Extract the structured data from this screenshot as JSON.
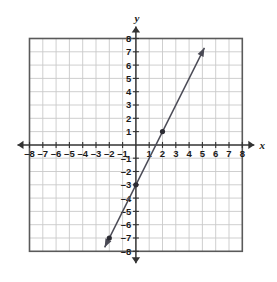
{
  "chart_data": {
    "type": "line",
    "title": "",
    "xlabel": "x",
    "ylabel": "y",
    "xlim": [
      -8,
      8
    ],
    "ylim": [
      -8,
      8
    ],
    "grid": true,
    "legend": null,
    "x_tick_labels": [
      "–8",
      "–7",
      "–6",
      "–5",
      "–4",
      "–3",
      "–2",
      "–1",
      "1",
      "2",
      "3",
      "4",
      "5",
      "6",
      "7",
      "8"
    ],
    "x_tick_values": [
      -8,
      -7,
      -6,
      -5,
      -4,
      -3,
      -2,
      -1,
      1,
      2,
      3,
      4,
      5,
      6,
      7,
      8
    ],
    "y_tick_labels": [
      "8",
      "7",
      "6",
      "5",
      "4",
      "3",
      "2",
      "1",
      "–1",
      "–2",
      "–3",
      "–4",
      "–5",
      "–6",
      "–7",
      "–8"
    ],
    "y_tick_values": [
      8,
      7,
      6,
      5,
      4,
      3,
      2,
      1,
      -1,
      -2,
      -3,
      -4,
      -5,
      -6,
      -7,
      -8
    ],
    "series": [
      {
        "name": "line",
        "equation": "y = 2x - 3",
        "slope": 2,
        "intercept": -3,
        "arrows": "both",
        "endpoints": [
          {
            "x": -2.35,
            "y": -7.7
          },
          {
            "x": 5.15,
            "y": 7.3
          }
        ],
        "points": [
          {
            "x": -2,
            "y": -7
          },
          {
            "x": 0,
            "y": -3
          },
          {
            "x": 2,
            "y": 1
          }
        ]
      }
    ],
    "colors": {
      "grid": "#c9c9c9",
      "border": "#5a5a5a",
      "axis": "#333333",
      "line": "#4a4a55",
      "point": "#2b2b33",
      "text": "#1a1a1a",
      "background": "#ffffff"
    }
  }
}
